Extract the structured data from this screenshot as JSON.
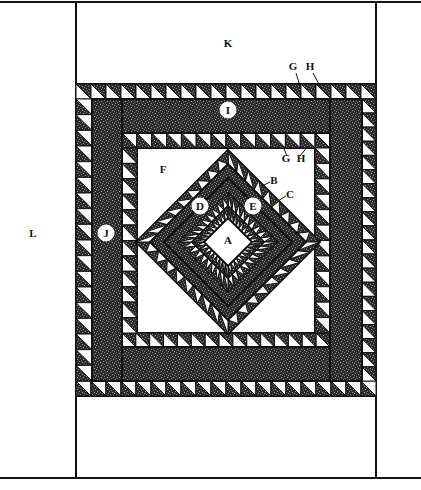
{
  "diagram": {
    "type": "quilt-assembly-diagram",
    "colors": {
      "background": "#ffffff",
      "line": "#111111",
      "dark_print": "#2b2b2b",
      "print_speckle": "#7a7a7a",
      "light": "#ffffff"
    },
    "labels": {
      "A": "A",
      "B": "B",
      "C": "C",
      "D": "D",
      "E": "E",
      "F": "F",
      "G": "G",
      "H": "H",
      "I": "I",
      "J": "J",
      "K": "K",
      "L": "L"
    },
    "label_positions": [
      {
        "key": "K",
        "x": 228,
        "y": 47,
        "circled": false
      },
      {
        "key": "G",
        "x": 293,
        "y": 70,
        "circled": false
      },
      {
        "key": "H",
        "x": 310,
        "y": 70,
        "circled": false
      },
      {
        "key": "I",
        "x": 228,
        "y": 114,
        "circled": true
      },
      {
        "key": "G",
        "x": 286,
        "y": 162,
        "circled": false
      },
      {
        "key": "H",
        "x": 301,
        "y": 162,
        "circled": false
      },
      {
        "key": "F",
        "x": 163,
        "y": 173,
        "circled": false
      },
      {
        "key": "B",
        "x": 274,
        "y": 184,
        "circled": false
      },
      {
        "key": "C",
        "x": 290,
        "y": 198,
        "circled": false
      },
      {
        "key": "D",
        "x": 200,
        "y": 210,
        "circled": true
      },
      {
        "key": "E",
        "x": 253,
        "y": 210,
        "circled": true
      },
      {
        "key": "J",
        "x": 106,
        "y": 237,
        "circled": true
      },
      {
        "key": "L",
        "x": 33,
        "y": 237,
        "circled": false
      },
      {
        "key": "A",
        "x": 228,
        "y": 244,
        "circled": false
      }
    ]
  }
}
